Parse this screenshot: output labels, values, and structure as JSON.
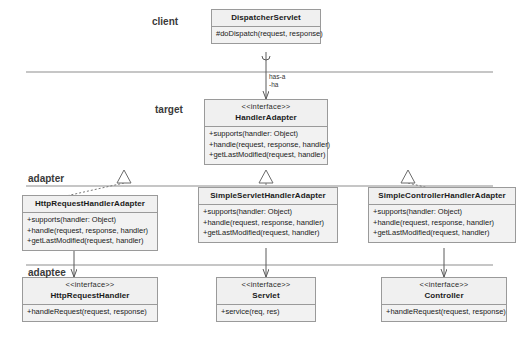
{
  "diagram": {
    "background": "#ffffff",
    "box_fill": "#f2f2f2",
    "box_stroke": "#9a9a9a",
    "line_color": "#6b6b6b"
  },
  "zones": [
    {
      "key": "client",
      "label": "client"
    },
    {
      "key": "target",
      "label": "target"
    },
    {
      "key": "adapter",
      "label": "adapter"
    },
    {
      "key": "adaptee",
      "label": "adaptee"
    }
  ],
  "classes": {
    "dispatcher_servlet": {
      "stereotype": "",
      "name": "DispatcherServlet",
      "members": [
        "#doDispatch(request, response)"
      ]
    },
    "handler_adapter": {
      "stereotype": "<<interface>>",
      "name": "HandlerAdapter",
      "members": [
        "+supports(handler: Object)",
        "+handle(request, response, handler)",
        "+getLastModified(request, handler)"
      ]
    },
    "http_request_handler_adapter": {
      "stereotype": "",
      "name": "HttpRequestHandlerAdapter",
      "members": [
        "+supports(handler: Object)",
        "+handle(request, response, handler)",
        "+getLastModified(request, handler)"
      ]
    },
    "simple_servlet_handler_adapter": {
      "stereotype": "",
      "name": "SimpleServletHandlerAdapter",
      "members": [
        "+supports(handler: Object)",
        "+handle(request, response, handler)",
        "+getLastModified(request, handler)"
      ]
    },
    "simple_controller_handler_adapter": {
      "stereotype": "",
      "name": "SimpleControllerHandlerAdapter",
      "members": [
        "+supports(handler: Object)",
        "+handle(request, response, handler)",
        "+getLastModified(request, handler)"
      ]
    },
    "http_request_handler": {
      "stereotype": "<<interface>>",
      "name": "HttpRequestHandler",
      "members": [
        "+handleRequest(request, response)"
      ]
    },
    "servlet": {
      "stereotype": "<<interface>>",
      "name": "Servlet",
      "members": [
        "+service(req, res)"
      ]
    },
    "controller": {
      "stereotype": "<<interface>>",
      "name": "Controller",
      "members": [
        "+handleRequest(request, response)"
      ]
    }
  },
  "edges": {
    "has_a": {
      "line1": "has-a",
      "line2": "-ha"
    }
  }
}
